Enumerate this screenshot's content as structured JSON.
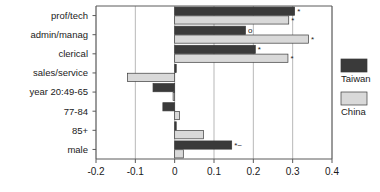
{
  "chart_data": {
    "type": "bar",
    "orientation": "horizontal",
    "title": "",
    "xlabel": "",
    "ylabel": "",
    "xlim": [
      -0.2,
      0.4
    ],
    "xticks": [
      -0.2,
      -0.1,
      0,
      0.1,
      0.2,
      0.3,
      0.4
    ],
    "xticklabels": [
      "-0.2",
      "-0.1",
      "0",
      "0.1",
      "0.2",
      "0.3",
      "0.4"
    ],
    "grid": true,
    "grid_axis": "x",
    "legend_position": "right-outside",
    "categories": [
      "prof/tech",
      "admin/manag",
      "clerical",
      "sales/service",
      "year 20:49-65",
      "77-84",
      "85+",
      "male"
    ],
    "series": [
      {
        "name": "Taiwan",
        "color": "#3a3a3a",
        "values": [
          0.305,
          0.18,
          0.205,
          0.004,
          -0.055,
          -0.03,
          0.004,
          0.145
        ],
        "markers": [
          "*",
          "o",
          "*",
          "",
          "",
          "",
          "",
          "*~"
        ]
      },
      {
        "name": "China",
        "color": "#d9d9d9",
        "values": [
          0.29,
          0.34,
          0.288,
          -0.12,
          -0.004,
          0.012,
          0.073,
          0.022
        ],
        "markers": [
          "*",
          "*",
          "*",
          "",
          "",
          "",
          "",
          ""
        ]
      }
    ]
  },
  "legend": {
    "entries": [
      {
        "label": "Taiwan",
        "color": "#3a3a3a"
      },
      {
        "label": "China",
        "color": "#d9d9d9"
      }
    ]
  }
}
